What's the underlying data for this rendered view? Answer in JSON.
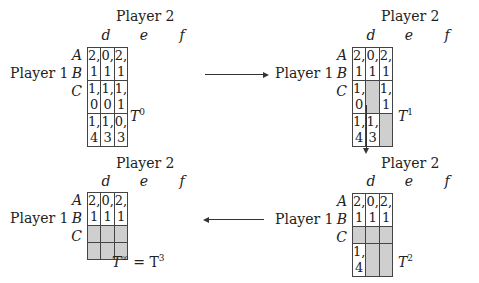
{
  "player2_label": "Player 2",
  "player1_label": "Player 1",
  "columns": [
    "d",
    "e",
    "f"
  ],
  "rows": [
    "A",
    "B",
    "C"
  ],
  "colors": {
    "eliminated": "#cfcfcf",
    "border": "#444444"
  },
  "panels": [
    {
      "id": "T0",
      "caption_base": "T",
      "caption_sup": "0",
      "caption_suffix": "",
      "cells": [
        [
          "2, 1",
          "0, 1",
          "2, 1"
        ],
        [
          "1, 0",
          "1, 0",
          "1, 1"
        ],
        [
          "1, 4",
          "1, 3",
          "0, 3"
        ]
      ],
      "eliminated": [
        [
          false,
          false,
          false
        ],
        [
          false,
          false,
          false
        ],
        [
          false,
          false,
          false
        ]
      ]
    },
    {
      "id": "T1",
      "caption_base": "T",
      "caption_sup": "1",
      "caption_suffix": "",
      "cells": [
        [
          "2, 1",
          "0, 1",
          "2, 1"
        ],
        [
          "1, 0",
          "",
          "1, 1"
        ],
        [
          "1, 4",
          "1, 3",
          ""
        ]
      ],
      "eliminated": [
        [
          false,
          false,
          false
        ],
        [
          false,
          true,
          false
        ],
        [
          false,
          false,
          true
        ]
      ]
    },
    {
      "id": "T2",
      "caption_base": "T",
      "caption_sup": "2",
      "caption_suffix": "",
      "cells": [
        [
          "2, 1",
          "0, 1",
          "2, 1"
        ],
        [
          "",
          "",
          ""
        ],
        [
          "1, 4",
          "",
          ""
        ]
      ],
      "eliminated": [
        [
          false,
          false,
          false
        ],
        [
          true,
          true,
          true
        ],
        [
          false,
          true,
          true
        ]
      ]
    },
    {
      "id": "Tinf",
      "caption_base": "T",
      "caption_sup": "∞",
      "caption_suffix": " = T",
      "caption_sup2": "3",
      "cells": [
        [
          "2, 1",
          "0, 1",
          "2, 1"
        ],
        [
          "",
          "",
          ""
        ],
        [
          "",
          "",
          ""
        ]
      ],
      "eliminated": [
        [
          false,
          false,
          false
        ],
        [
          true,
          true,
          true
        ],
        [
          true,
          true,
          true
        ]
      ]
    }
  ],
  "arrows": [
    {
      "from": "T0",
      "to": "T1",
      "direction": "right"
    },
    {
      "from": "T1",
      "to": "T2",
      "direction": "down"
    },
    {
      "from": "T2",
      "to": "Tinf",
      "direction": "left"
    }
  ]
}
